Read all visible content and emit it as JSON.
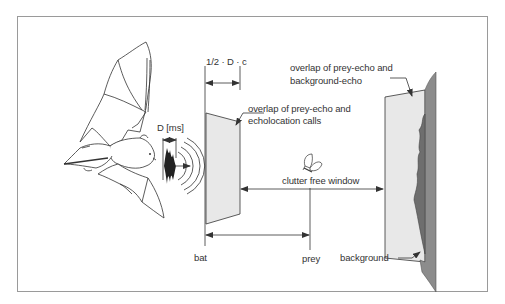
{
  "figure": {
    "type": "schematic diagram",
    "colors": {
      "frame": "#8a8a8a",
      "line": "#333333",
      "echo_fill": "#e6e6e6",
      "background_fill": "#8c8c8c",
      "background_dark": "#6e6e6e",
      "text": "#333333"
    }
  },
  "labels": {
    "half_d_c": "1/2 · D · c",
    "duration": "D [ms]",
    "overlap_calls_line1": "overlap of prey-echo and",
    "overlap_calls_line2": "echolocation calls",
    "overlap_bg_line1": "overlap of prey-echo and",
    "overlap_bg_line2": "background-echo",
    "clutter_free_window": "clutter free window",
    "bat": "bat",
    "prey": "prey",
    "background": "background"
  },
  "icons": {
    "bat": "bat-illustration-icon",
    "call": "sound-wave-pulse-icon",
    "prey": "moth-icon"
  }
}
